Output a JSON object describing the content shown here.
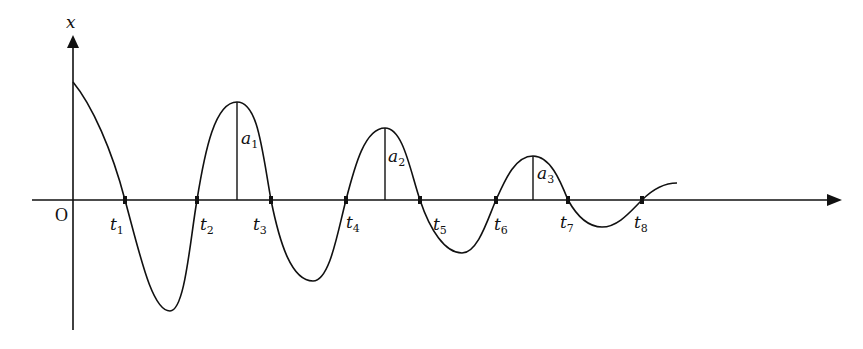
{
  "diagram": {
    "axis": {
      "y_label": "x",
      "origin_label": "O"
    },
    "zero_crossings": [
      {
        "name": "t",
        "sub": "1",
        "x": 125
      },
      {
        "name": "t",
        "sub": "2",
        "x": 197
      },
      {
        "name": "t",
        "sub": "3",
        "x": 271
      },
      {
        "name": "t",
        "sub": "4",
        "x": 346
      },
      {
        "name": "t",
        "sub": "5",
        "x": 420
      },
      {
        "name": "t",
        "sub": "6",
        "x": 496
      },
      {
        "name": "t",
        "sub": "7",
        "x": 568
      },
      {
        "name": "t",
        "sub": "8",
        "x": 642
      }
    ],
    "amplitudes": [
      {
        "name": "a",
        "sub": "1"
      },
      {
        "name": "a",
        "sub": "2"
      },
      {
        "name": "a",
        "sub": "3"
      }
    ],
    "colors": {
      "stroke": "#111111",
      "background": "#ffffff"
    }
  }
}
